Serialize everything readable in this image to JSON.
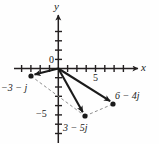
{
  "figure": {
    "axes": {
      "x_label": "x",
      "y_label": "y",
      "origin_label": "0",
      "x_tick_label": "5",
      "y_tick_label": "−5",
      "x_range": [
        -4,
        9
      ],
      "y_range": [
        -8,
        5
      ],
      "grid": false,
      "tick_spacing": 1
    },
    "colors": {
      "axis": "#231f20",
      "vector": "#1a1a1a",
      "dashed": "#8a8a8a",
      "point": "#1a1a1a",
      "background": "#fefefe"
    },
    "points": [
      {
        "id": "p1",
        "label": "−3 − j",
        "x": -3,
        "y": -1,
        "px": 31,
        "py": 76
      },
      {
        "id": "p2",
        "label": "3 − 5j",
        "x": 3,
        "y": -5,
        "px": 85,
        "py": 116
      },
      {
        "id": "p3",
        "label": "6 − 4j",
        "x": 6,
        "y": -4,
        "px": 113,
        "py": 104
      }
    ],
    "vectors": [
      {
        "from": "origin",
        "to": "p1",
        "style": "solid-arrow"
      },
      {
        "from": "origin",
        "to": "p2",
        "style": "solid-arrow"
      },
      {
        "from": "origin",
        "to": "p3",
        "style": "solid-arrow"
      }
    ],
    "construction_lines": [
      {
        "from": "p1",
        "to": "p2",
        "style": "dashed"
      },
      {
        "from": "p2",
        "to": "p3",
        "style": "dashed"
      }
    ],
    "label_positions": {
      "x_label": {
        "left": 141,
        "top": 63
      },
      "y_label": {
        "left": 54,
        "top": 2
      },
      "origin": {
        "left": 49,
        "top": 56
      },
      "x_tick_5": {
        "left": 93,
        "top": 74
      },
      "y_tick_5": {
        "left": 37,
        "top": 110
      },
      "p1": {
        "left": 2,
        "top": 84
      },
      "p2": {
        "left": 64,
        "top": 124
      },
      "p3": {
        "left": 116,
        "top": 92
      }
    }
  }
}
